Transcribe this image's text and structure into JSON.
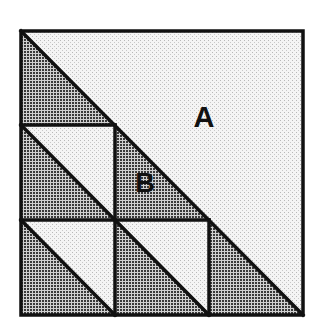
{
  "figure": {
    "type": "geometric-dissection",
    "grid_size": 3,
    "square": {
      "x": 21,
      "y": 31,
      "size": 282
    },
    "colors": {
      "outline": "#111111",
      "light_fill": "#ececec",
      "dark_fill": "#8c8c8c",
      "background": "#ffffff"
    },
    "labels": [
      {
        "id": "A",
        "text": "A",
        "x": 204,
        "y": 127
      },
      {
        "id": "B",
        "text": "B",
        "x": 145,
        "y": 192
      }
    ]
  }
}
